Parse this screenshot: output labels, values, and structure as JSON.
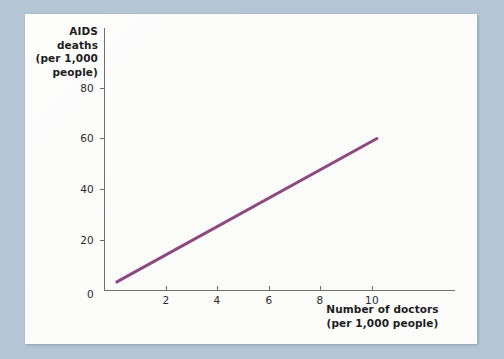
{
  "figure": {
    "background_color": "#b4c5d5",
    "card_color": "#fbfbfa"
  },
  "chart_data": {
    "type": "line",
    "title": "",
    "subtitle": "",
    "xlabel": "Number of doctors (per 1,000 people)",
    "ylabel": "AIDS deaths (per 1,000 people)",
    "ylabel_lines": [
      "AIDS",
      "deaths",
      "(per 1,000",
      "people)"
    ],
    "xlabel_lines": [
      "Number of doctors",
      "(per 1,000 people)"
    ],
    "xlim": [
      0,
      13.5
    ],
    "ylim": [
      0,
      90
    ],
    "xticks": [
      2,
      4,
      6,
      8,
      10
    ],
    "yticks": [
      0,
      20,
      40,
      60,
      80
    ],
    "xtick_labels": [
      "2",
      "4",
      "6",
      "8",
      "10"
    ],
    "ytick_labels": [
      "0",
      "20",
      "40",
      "60",
      "80"
    ],
    "grid": false,
    "legend": null,
    "line_color": "#8c4a80",
    "line_width": 3,
    "series": [
      {
        "name": "AIDS deaths vs doctors",
        "x": [
          0.5,
          10.6
        ],
        "y": [
          3.2,
          60.0
        ],
        "points": [
          [
            0.5,
            3.2
          ],
          [
            10.6,
            60.0
          ]
        ]
      }
    ],
    "annotations": []
  }
}
